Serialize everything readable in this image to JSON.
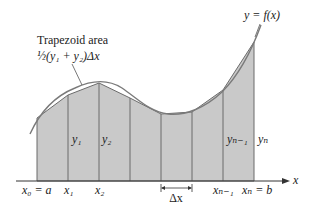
{
  "function_label": "y = f(x)",
  "annotation": {
    "title": "Trapezoid area",
    "formula": "½(y₁ + y₂)Δx"
  },
  "axis": {
    "x_label": "x"
  },
  "x_ticks": [
    {
      "label": "x₀ = a"
    },
    {
      "label": "x₁"
    },
    {
      "label": "x₂"
    },
    {
      "label": "xₙ₋₁"
    },
    {
      "label": "xₙ = b"
    }
  ],
  "y_labels": [
    {
      "label": "y₁"
    },
    {
      "label": "y₂"
    },
    {
      "label": "yₙ₋₁"
    },
    {
      "label": "yₙ"
    }
  ],
  "delta_label": "Δx",
  "colors": {
    "fill": "#c9c9c9",
    "lines": "#6b6b6b",
    "curve": "#7a7a7a",
    "axis": "#333333"
  }
}
